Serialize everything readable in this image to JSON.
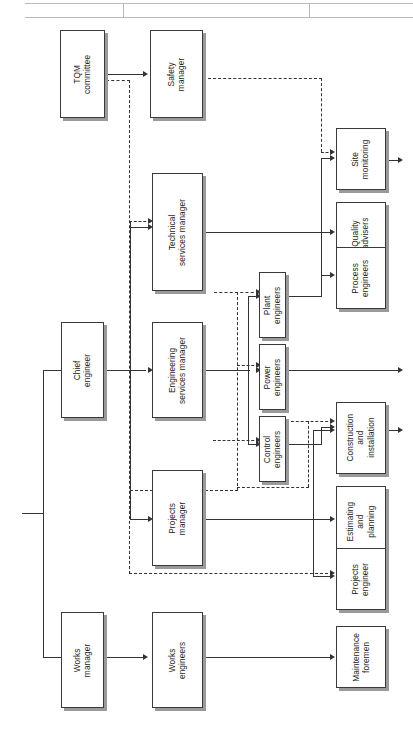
{
  "diagram": {
    "orientation": "rotated-90",
    "background_color": "#ffffff",
    "line_color": "#333333",
    "box_border_color": "#3a3a3a",
    "box_shadow_color": "#9a9a9a"
  },
  "nodes": {
    "tqm_committee": "TQM\ncommittee",
    "safety_manager": "Safety\nmanager",
    "technical_services_manager": "Technical\nservices manager",
    "chief_engineer": "Chief\nengineer",
    "engineering_services_manager": "Engineering\nservices manager",
    "projects_manager": "Projects\nmanager",
    "works_manager": "Works\nmanager",
    "works_engineers": "Works\nengineers",
    "plant_engineers": "Plant\nengineers",
    "power_engineers": "Power\nengineers",
    "control_engineers": "Control\nengineers",
    "site_monitoring": "Site\nmonitoring",
    "quality_advisers": "Quality\nadvisers",
    "process_engineers": "Process\nengineers",
    "construction_and_installation": "Construction\nand\ninstallation",
    "estimating_and_planning": "Estimating\nand\nplanning",
    "projects_engineer": "Projects\nengineer",
    "maintenance_foremen": "Maintenance\nforemen"
  },
  "edges": [
    {
      "from": "tqm_committee",
      "to": "safety_manager",
      "style": "solid"
    },
    {
      "from": "tqm_committee",
      "to": "technical_services_manager",
      "style": "dashed"
    },
    {
      "from": "tqm_committee",
      "to": "projects_engineer",
      "style": "dashed"
    },
    {
      "from": "safety_manager",
      "to": "site_monitoring",
      "style": "dashed"
    },
    {
      "from": "chief_engineer",
      "to": "technical_services_manager",
      "style": "solid"
    },
    {
      "from": "chief_engineer",
      "to": "engineering_services_manager",
      "style": "solid"
    },
    {
      "from": "chief_engineer",
      "to": "projects_manager",
      "style": "solid"
    },
    {
      "from": "chief_engineer",
      "to": "works_manager",
      "style": "solid"
    },
    {
      "from": "technical_services_manager",
      "to": "site_monitoring",
      "style": "solid"
    },
    {
      "from": "technical_services_manager",
      "to": "quality_advisers",
      "style": "solid"
    },
    {
      "from": "technical_services_manager",
      "to": "process_engineers",
      "style": "solid"
    },
    {
      "from": "engineering_services_manager",
      "to": "plant_engineers",
      "style": "solid"
    },
    {
      "from": "engineering_services_manager",
      "to": "power_engineers",
      "style": "solid"
    },
    {
      "from": "engineering_services_manager",
      "to": "control_engineers",
      "style": "solid"
    },
    {
      "from": "plant_engineers",
      "to": "process_engineers",
      "style": "solid"
    },
    {
      "from": "control_engineers",
      "to": "construction_and_installation",
      "style": "solid"
    },
    {
      "from": "control_engineers",
      "to": "construction_and_installation",
      "style": "dashed"
    },
    {
      "from": "projects_manager",
      "to": "construction_and_installation",
      "style": "solid"
    },
    {
      "from": "projects_manager",
      "to": "estimating_and_planning",
      "style": "solid"
    },
    {
      "from": "projects_manager",
      "to": "projects_engineer",
      "style": "solid"
    },
    {
      "from": "works_manager",
      "to": "works_engineers",
      "style": "solid"
    },
    {
      "from": "works_engineers",
      "to": "maintenance_foremen",
      "style": "solid"
    }
  ]
}
